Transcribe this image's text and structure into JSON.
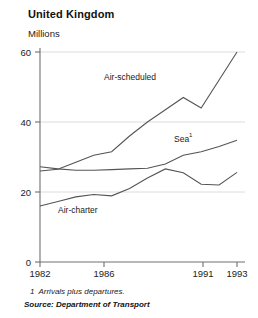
{
  "header": {
    "title": "United Kingdom",
    "y_axis_title": "Millions"
  },
  "footer": {
    "footnote_marker": "1",
    "footnote_text": "Arrivals plus departures.",
    "source_text": "Source: Department of Transport"
  },
  "labels": {
    "air_scheduled": "Air-scheduled",
    "sea": "Sea",
    "sea_superscript": "1",
    "air_charter": "Air-charter"
  },
  "colors": {
    "line": "#555555",
    "axis": "#777777",
    "grid": "#d8d8d8",
    "text": "#111111",
    "background": "#ffffff"
  },
  "chart_data": {
    "type": "line",
    "title": "United Kingdom",
    "subtitle": "Millions",
    "xlabel": "",
    "ylabel": "Millions",
    "xlim": [
      1982,
      1993
    ],
    "ylim": [
      0,
      60
    ],
    "yticks": [
      0,
      20,
      40,
      60
    ],
    "ytick_labels": [
      "0",
      "20",
      "40",
      "60"
    ],
    "xticks": [
      1982,
      1986,
      1991,
      1993
    ],
    "xtick_labels": [
      "1982",
      "1986",
      "1991",
      "1993"
    ],
    "grid": true,
    "legend": "inline-annotations",
    "x": [
      1982,
      1983,
      1984,
      1985,
      1986,
      1987,
      1988,
      1989,
      1990,
      1991,
      1992,
      1993
    ],
    "series": [
      {
        "name": "Air-scheduled",
        "values": [
          26.0,
          26.5,
          28.5,
          30.5,
          31.5,
          36.0,
          40.0,
          43.5,
          47.0,
          44.0,
          52.0,
          60.0
        ]
      },
      {
        "name": "Sea",
        "values": [
          27.2,
          26.6,
          26.2,
          26.2,
          26.4,
          26.6,
          26.8,
          28.0,
          30.5,
          31.5,
          33.0,
          34.8
        ]
      },
      {
        "name": "Air-charter",
        "values": [
          16.0,
          17.3,
          18.6,
          19.3,
          18.9,
          21.0,
          24.0,
          26.6,
          25.5,
          22.2,
          22.0,
          25.6
        ]
      }
    ],
    "annotations": [
      {
        "text": "Air-scheduled",
        "x": 1986.0,
        "y": 42.0
      },
      {
        "text": "Sea¹",
        "x": 1990.3,
        "y": 36.5
      },
      {
        "text": "Air-charter",
        "x": 1984.0,
        "y": 13.0
      }
    ]
  }
}
